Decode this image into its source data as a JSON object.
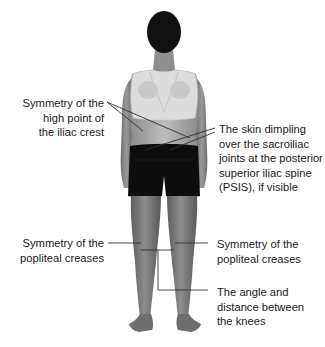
{
  "figure": {
    "colors": {
      "background": "#ffffff",
      "text": "#1a1a1a",
      "leader_line": "#333333",
      "skin": "#8a8a8a",
      "hair": "#111111",
      "shorts": "#0d0d0d",
      "top": "#d9d9d9"
    }
  },
  "annotations": [
    {
      "id": "iliac-crest",
      "side": "left",
      "lines": [
        "Symmetry of the",
        "high point of",
        "the iliac crest"
      ]
    },
    {
      "id": "psis",
      "side": "right",
      "lines": [
        "The skin dimpling",
        "over the sacroiliac",
        "joints at the posterior",
        "superior iliac spine",
        "(PSIS), if visible"
      ]
    },
    {
      "id": "popliteal-left",
      "side": "left",
      "lines": [
        "Symmetry of the",
        "popliteal creases"
      ]
    },
    {
      "id": "popliteal-right",
      "side": "right",
      "lines": [
        "Symmetry of the",
        "popliteal creases"
      ]
    },
    {
      "id": "knees",
      "side": "right",
      "lines": [
        "The angle and",
        "distance between",
        "the knees"
      ]
    }
  ]
}
